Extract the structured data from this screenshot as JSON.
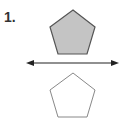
{
  "problem": {
    "number_label": "1.",
    "description": "Reflection of a pentagon across a horizontal line"
  },
  "figures": {
    "original_pentagon": {
      "fill": "#c4c4c4",
      "stroke": "#555555",
      "points": "73,10 95,27 87,54 58,54 50,27"
    },
    "reflection_line": {
      "stroke": "#222222",
      "y": 63,
      "x1": 27,
      "x2": 118
    },
    "image_pentagon": {
      "fill": "#ffffff",
      "stroke": "#888888",
      "points": "73,73 95,90 87,117 58,117 50,90"
    }
  }
}
